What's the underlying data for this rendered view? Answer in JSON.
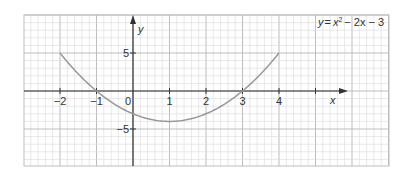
{
  "chart_data": {
    "type": "line",
    "title": "",
    "equation_label": "y = x² − 2x − 3",
    "equation_parts": {
      "lhs": "y",
      "eq": "=",
      "x": "x",
      "power": "2",
      "rest": "− 2x − 3"
    },
    "xlabel": "x",
    "ylabel": "y",
    "xlim": [
      -3.0,
      7.0
    ],
    "ylim": [
      -10.0,
      10.0
    ],
    "x_ticks": [
      {
        "value": -2,
        "label": "−2"
      },
      {
        "value": -1,
        "label": "−1"
      },
      {
        "value": 0,
        "label": "0"
      },
      {
        "value": 1,
        "label": "1"
      },
      {
        "value": 2,
        "label": "2"
      },
      {
        "value": 3,
        "label": "3"
      },
      {
        "value": 4,
        "label": "4"
      },
      {
        "value": 5,
        "label": ""
      }
    ],
    "y_ticks": [
      {
        "value": 5,
        "label": "5"
      },
      {
        "value": -5,
        "label": "−5"
      }
    ],
    "grid": true,
    "series": [
      {
        "name": "y = x^2 - 2x - 3",
        "x": [
          -2,
          -1.5,
          -1,
          -0.5,
          0,
          0.5,
          1,
          1.5,
          2,
          2.5,
          3,
          3.5,
          4
        ],
        "y": [
          5,
          2.25,
          0,
          -1.75,
          -3,
          -3.75,
          -4,
          -3.75,
          -3,
          -1.75,
          0,
          2.25,
          5
        ],
        "color": "#999999"
      }
    ],
    "key_points": {
      "roots": [
        -1,
        3
      ],
      "vertex": [
        1,
        -4
      ],
      "y_intercept": -3
    }
  },
  "colors": {
    "grid_minor": "#d9d9d9",
    "grid_major": "#bdbdbd",
    "axis": "#333333",
    "curve": "#999999",
    "background": "#ffffff"
  }
}
